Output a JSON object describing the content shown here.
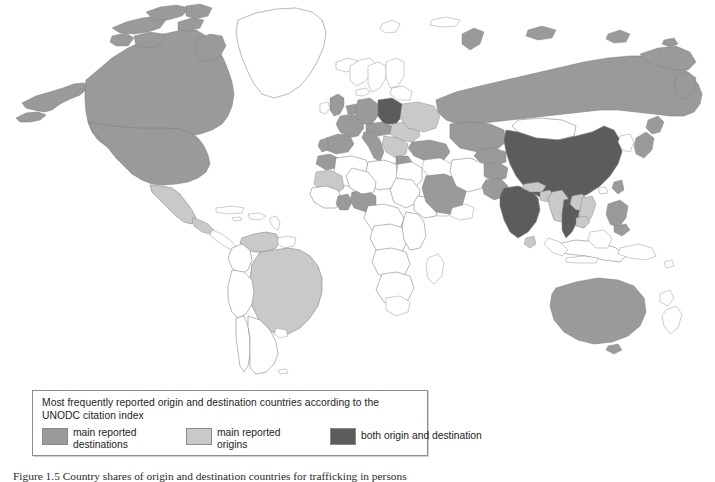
{
  "figure": {
    "caption": "Figure 1.5   Country shares of origin and destination countries for trafficking in persons",
    "caption_label": "Figure 1.5"
  },
  "legend": {
    "title": "Most frequently reported origin and destination countries according to the UNODC citation index",
    "items": [
      {
        "label_line1": "main reported",
        "label_line2": "destinations",
        "color": "#9a9a9a",
        "name": "destinations"
      },
      {
        "label_line1": "main reported",
        "label_line2": "origins",
        "color": "#c9c9c9",
        "name": "origins"
      },
      {
        "label_line1": "both origin and destination",
        "label_line2": "",
        "color": "#5c5c5c",
        "name": "both"
      }
    ]
  },
  "map": {
    "type": "choropleth",
    "projection": "world-equirectangular",
    "background": "#ffffff",
    "border_color": "#7d7d7d",
    "categories": {
      "destination": "#9a9a9a",
      "origin": "#c9c9c9",
      "both": "#5c5c5c",
      "none": "#ffffff"
    },
    "regions": [
      {
        "name": "Canada",
        "category": "destination"
      },
      {
        "name": "United States",
        "category": "destination"
      },
      {
        "name": "Alaska",
        "category": "destination"
      },
      {
        "name": "Mexico",
        "category": "origin"
      },
      {
        "name": "Guatemala",
        "category": "origin"
      },
      {
        "name": "Brazil",
        "category": "origin"
      },
      {
        "name": "Venezuela",
        "category": "origin"
      },
      {
        "name": "Colombia",
        "category": "none"
      },
      {
        "name": "Argentina",
        "category": "none"
      },
      {
        "name": "Chile",
        "category": "none"
      },
      {
        "name": "Peru",
        "category": "none"
      },
      {
        "name": "Greenland",
        "category": "none"
      },
      {
        "name": "Iceland",
        "category": "none"
      },
      {
        "name": "United Kingdom",
        "category": "destination"
      },
      {
        "name": "Ireland",
        "category": "none"
      },
      {
        "name": "France",
        "category": "destination"
      },
      {
        "name": "Spain",
        "category": "destination"
      },
      {
        "name": "Portugal",
        "category": "destination"
      },
      {
        "name": "Germany",
        "category": "destination"
      },
      {
        "name": "Netherlands",
        "category": "destination"
      },
      {
        "name": "Belgium",
        "category": "destination"
      },
      {
        "name": "Italy",
        "category": "destination"
      },
      {
        "name": "Poland",
        "category": "both"
      },
      {
        "name": "Czech Republic",
        "category": "destination"
      },
      {
        "name": "Austria",
        "category": "destination"
      },
      {
        "name": "Hungary",
        "category": "destination"
      },
      {
        "name": "Greece",
        "category": "destination"
      },
      {
        "name": "Romania",
        "category": "origin"
      },
      {
        "name": "Bulgaria",
        "category": "origin"
      },
      {
        "name": "Ukraine",
        "category": "origin"
      },
      {
        "name": "Belarus",
        "category": "origin"
      },
      {
        "name": "Sweden",
        "category": "none"
      },
      {
        "name": "Norway",
        "category": "none"
      },
      {
        "name": "Finland",
        "category": "none"
      },
      {
        "name": "Denmark",
        "category": "none"
      },
      {
        "name": "Turkey",
        "category": "destination"
      },
      {
        "name": "Russia",
        "category": "destination"
      },
      {
        "name": "Kazakhstan",
        "category": "destination"
      },
      {
        "name": "Mongolia",
        "category": "none"
      },
      {
        "name": "China",
        "category": "both"
      },
      {
        "name": "India",
        "category": "both"
      },
      {
        "name": "Pakistan",
        "category": "destination"
      },
      {
        "name": "Nepal",
        "category": "origin"
      },
      {
        "name": "Bangladesh",
        "category": "origin"
      },
      {
        "name": "Myanmar",
        "category": "origin"
      },
      {
        "name": "Thailand",
        "category": "both"
      },
      {
        "name": "Laos",
        "category": "origin"
      },
      {
        "name": "Vietnam",
        "category": "origin"
      },
      {
        "name": "Cambodia",
        "category": "origin"
      },
      {
        "name": "Malaysia",
        "category": "none"
      },
      {
        "name": "Indonesia",
        "category": "none"
      },
      {
        "name": "Philippines",
        "category": "destination"
      },
      {
        "name": "Japan",
        "category": "destination"
      },
      {
        "name": "South Korea",
        "category": "none"
      },
      {
        "name": "Taiwan",
        "category": "destination"
      },
      {
        "name": "Australia",
        "category": "destination"
      },
      {
        "name": "New Zealand",
        "category": "none"
      },
      {
        "name": "Papua New Guinea",
        "category": "none"
      },
      {
        "name": "Saudi Arabia",
        "category": "destination"
      },
      {
        "name": "Yemen",
        "category": "none"
      },
      {
        "name": "Iran",
        "category": "none"
      },
      {
        "name": "Iraq",
        "category": "none"
      },
      {
        "name": "Nigeria",
        "category": "destination"
      },
      {
        "name": "Ghana",
        "category": "destination"
      },
      {
        "name": "Benin",
        "category": "destination"
      },
      {
        "name": "Morocco",
        "category": "destination"
      },
      {
        "name": "Algeria",
        "category": "none"
      },
      {
        "name": "Libya",
        "category": "none"
      },
      {
        "name": "Egypt",
        "category": "none"
      },
      {
        "name": "Sudan",
        "category": "none"
      },
      {
        "name": "Ethiopia",
        "category": "none"
      },
      {
        "name": "Kenya",
        "category": "none"
      },
      {
        "name": "South Africa",
        "category": "none"
      },
      {
        "name": "Madagascar",
        "category": "none"
      },
      {
        "name": "Mali",
        "category": "origin"
      }
    ]
  }
}
